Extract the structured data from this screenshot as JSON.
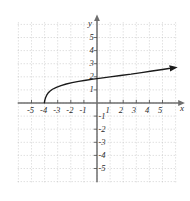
{
  "chart_data": {
    "type": "line",
    "title": "",
    "subtitle": "",
    "xlabel": "x",
    "ylabel": "y",
    "xlim": [
      -6,
      6
    ],
    "ylim": [
      -6,
      6
    ],
    "grid": true,
    "grid_style": "dotted",
    "grid_step": 1,
    "legend": "none",
    "axis_arrows": {
      "x_positive": true,
      "y_positive": true
    },
    "x_tick_labels": [
      "-5",
      "-4",
      "-3",
      "-2",
      "-1",
      "1",
      "2",
      "3",
      "4",
      "5"
    ],
    "x_tick_values": [
      -5,
      -4,
      -3,
      -2,
      -1,
      1,
      2,
      3,
      4,
      5
    ],
    "y_tick_labels": [
      "5",
      "4",
      "3",
      "2",
      "1",
      "-1",
      "-2",
      "-3",
      "-4",
      "-5"
    ],
    "y_tick_values": [
      5,
      4,
      3,
      2,
      1,
      -1,
      -2,
      -3,
      -4,
      -5
    ],
    "series": [
      {
        "name": "curve",
        "color": "#1a1a1a",
        "arrow_end": true,
        "asymptote_x": -4.05,
        "points": [
          [
            -4.02,
            0.02
          ],
          [
            -3.98,
            0.22
          ],
          [
            -3.92,
            0.42
          ],
          [
            -3.85,
            0.58
          ],
          [
            -3.75,
            0.74
          ],
          [
            -3.6,
            0.9
          ],
          [
            -3.4,
            1.05
          ],
          [
            -3.1,
            1.2
          ],
          [
            -2.75,
            1.33
          ],
          [
            -2.35,
            1.45
          ],
          [
            -1.9,
            1.55
          ],
          [
            -1.4,
            1.65
          ],
          [
            -0.85,
            1.74
          ],
          [
            -0.3,
            1.82
          ],
          [
            0.3,
            1.9
          ],
          [
            1.0,
            1.99
          ],
          [
            1.8,
            2.1
          ],
          [
            2.6,
            2.2
          ],
          [
            3.4,
            2.32
          ],
          [
            4.2,
            2.44
          ],
          [
            5.0,
            2.56
          ],
          [
            5.6,
            2.65
          ]
        ]
      }
    ]
  },
  "colors": {
    "grid": "#b9b9b9",
    "axis": "#6e6e6e",
    "curve": "#1a1a1a",
    "label": "#2b2b2b",
    "background": "#ffffff"
  }
}
